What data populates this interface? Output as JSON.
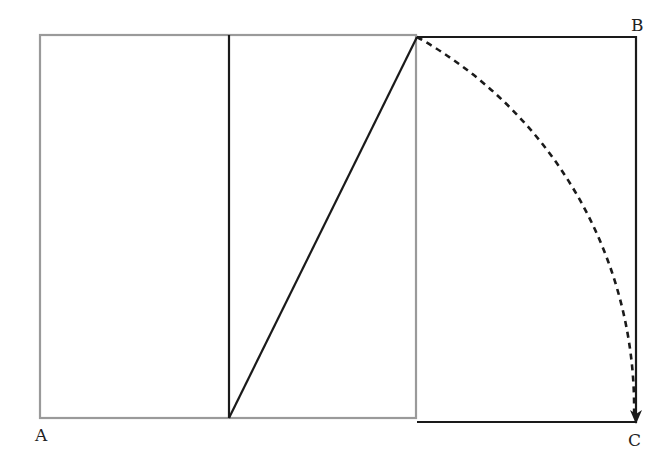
{
  "diagram": {
    "type": "golden-rectangle-construction",
    "labels": [
      {
        "id": "A",
        "text": "A",
        "x": 35,
        "y": 441
      },
      {
        "id": "B",
        "text": "B",
        "x": 631,
        "y": 31
      },
      {
        "id": "C",
        "text": "C",
        "x": 628,
        "y": 446
      }
    ],
    "colors": {
      "square_stroke": "#9a9a9a",
      "extension_stroke": "#1a1a1a",
      "arc_stroke": "#1a1a1a",
      "background": "#ffffff"
    },
    "square": {
      "x1": 40,
      "y1": 35,
      "x2": 416,
      "y2": 418
    },
    "midline": {
      "x": 229,
      "y1": 35,
      "y2": 418
    },
    "diagonal": {
      "x1": 229,
      "y1": 418,
      "x2": 417,
      "y2": 37
    },
    "extension_rect": {
      "x1": 417,
      "y1": 37,
      "x2": 636,
      "y2": 422
    },
    "arc": {
      "cx": 229,
      "cy": 418,
      "start": [
        417,
        37
      ],
      "end": [
        636,
        418
      ],
      "dashed": true,
      "arrow_at_end": true
    }
  }
}
